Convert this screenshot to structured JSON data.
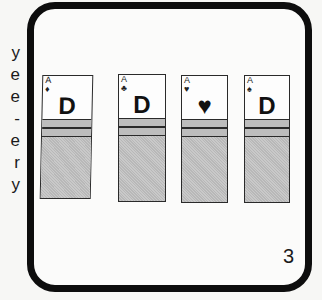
{
  "side_text": {
    "letters": [
      "y",
      "e",
      "e",
      "-",
      "e",
      "r",
      "y"
    ]
  },
  "cards": [
    {
      "rank": "A",
      "suit": "♦",
      "center": "D"
    },
    {
      "rank": "A",
      "suit": "♣",
      "center": "D"
    },
    {
      "rank": "A",
      "suit": "♥",
      "center": "♥"
    },
    {
      "rank": "A",
      "suit": "♠",
      "center": "D"
    }
  ],
  "page_number": "3",
  "colors": {
    "frame": "#0d0d0d",
    "card_gray": "#c0c0c0"
  }
}
